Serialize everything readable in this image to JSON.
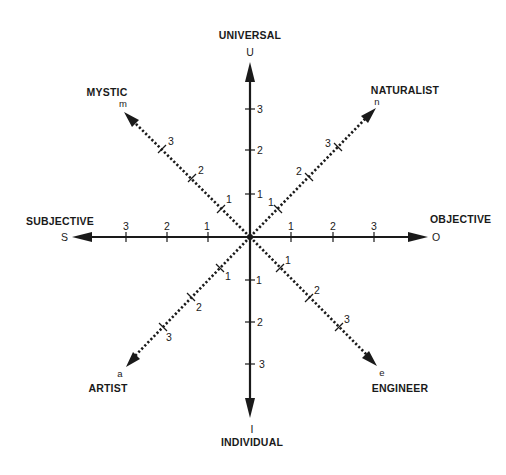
{
  "diagram": {
    "center": {
      "x": 250,
      "y": 237
    },
    "color": "#1a1a1a",
    "background": "#ffffff",
    "axes": {
      "universal": {
        "label": "UNIVERSAL",
        "letter": "U",
        "ticks": [
          "1",
          "2",
          "3"
        ]
      },
      "individual": {
        "label": "INDIVIDUAL",
        "letter": "I",
        "ticks": [
          "1",
          "2",
          "3"
        ]
      },
      "subjective": {
        "label": "SUBJECTIVE",
        "letter": "S",
        "ticks": [
          "1",
          "2",
          "3"
        ]
      },
      "objective": {
        "label": "OBJECTIVE",
        "letter": "O",
        "ticks": [
          "1",
          "2",
          "3"
        ]
      },
      "mystic": {
        "label": "MYSTIC",
        "letter": "m",
        "ticks": [
          "1",
          "2",
          "3"
        ]
      },
      "naturalist": {
        "label": "NATURALIST",
        "letter": "n",
        "ticks": [
          "1",
          "2",
          "3"
        ]
      },
      "artist": {
        "label": "ARTIST",
        "letter": "a",
        "ticks": [
          "1",
          "2",
          "3"
        ]
      },
      "engineer": {
        "label": "ENGINEER",
        "letter": "e",
        "ticks": [
          "1",
          "2",
          "3"
        ]
      }
    }
  }
}
